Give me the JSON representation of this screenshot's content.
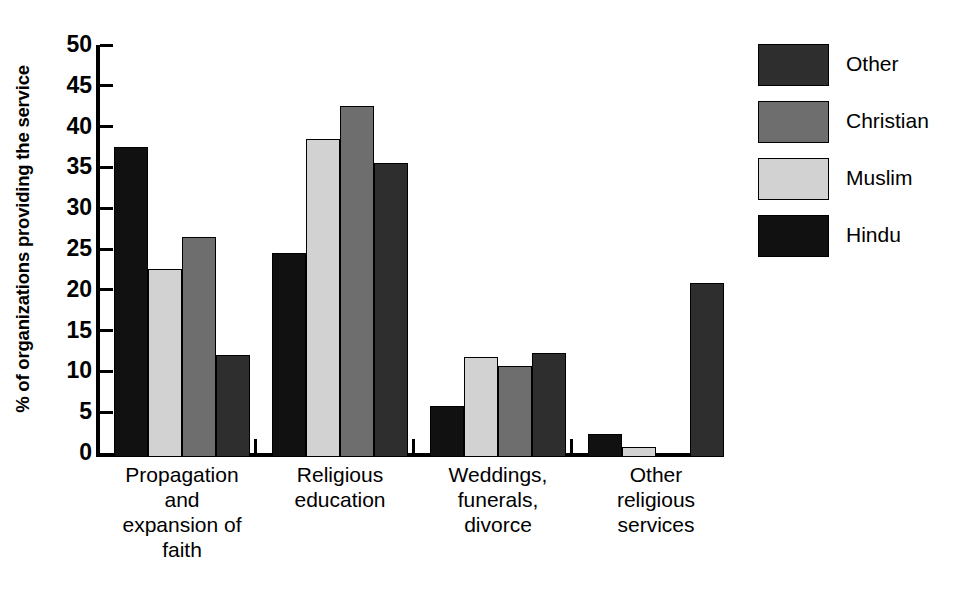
{
  "chart_data": {
    "type": "bar",
    "title": "",
    "subtitle": "",
    "xlabel": "",
    "ylabel": "% of organizations providing the service",
    "ylim": [
      0,
      50
    ],
    "ytick_step": 5,
    "yticks": [
      50,
      45,
      40,
      35,
      30,
      25,
      20,
      15,
      10,
      5,
      0
    ],
    "ytick_labels": [
      "50",
      "45",
      "40",
      "35",
      "30",
      "25",
      "20",
      "15",
      "10",
      "5",
      "0"
    ],
    "grid": false,
    "legend_position": "right",
    "categories": [
      "Propagation and expansion of faith",
      "Religious education",
      "Weddings, funerals, divorce",
      "Other religious services"
    ],
    "category_label_lines": [
      [
        "Propagation",
        "and",
        "expansion of",
        "faith"
      ],
      [
        "Religious",
        "education"
      ],
      [
        "Weddings,",
        "funerals,",
        "divorce"
      ],
      [
        "Other",
        "religious",
        "services"
      ]
    ],
    "series": [
      {
        "name": "Hindu",
        "color": "#111111",
        "values": [
          38.0,
          25.0,
          6.2,
          2.8
        ]
      },
      {
        "name": "Muslim",
        "color": "#d2d2d2",
        "values": [
          23.0,
          39.0,
          12.2,
          1.2
        ]
      },
      {
        "name": "Christian",
        "color": "#6e6e6e",
        "values": [
          27.0,
          43.0,
          11.2,
          0.0
        ]
      },
      {
        "name": "Other",
        "color": "#2e2e2e",
        "values": [
          12.5,
          36.0,
          12.7,
          21.3
        ]
      }
    ],
    "legend_entries": [
      {
        "label": "Other",
        "color": "#2e2e2e"
      },
      {
        "label": "Christian",
        "color": "#6e6e6e"
      },
      {
        "label": "Muslim",
        "color": "#d2d2d2"
      },
      {
        "label": "Hindu",
        "color": "#111111"
      }
    ]
  }
}
